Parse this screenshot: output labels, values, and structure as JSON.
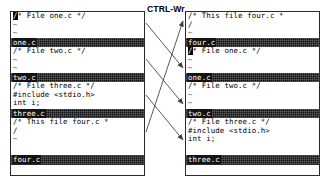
{
  "caption": {
    "key_command": "CTRL-Wr"
  },
  "colors": {
    "background": "#ffffff",
    "text": "#000000",
    "border": "#2b2b2b",
    "status_bar_bg": "#131313",
    "status_bar_text": "#ffffff",
    "arrow": "#3c3c3c"
  },
  "left_frame": {
    "name": "before-rotation",
    "windows": [
      {
        "file": "one.c",
        "cursor_on_first_char": true,
        "lines": [
          "/* File one.c */",
          "~",
          "~"
        ]
      },
      {
        "file": "two.c",
        "cursor_on_first_char": false,
        "lines": [
          "/* File two.c */",
          "~",
          "~"
        ]
      },
      {
        "file": "three.c",
        "cursor_on_first_char": false,
        "lines": [
          "/* File three.c */",
          "#include <stdio.h>",
          "int i;"
        ]
      },
      {
        "file": "four.c",
        "cursor_on_first_char": false,
        "lines": [
          "/* This file four.c *",
          "/",
          "~"
        ]
      }
    ],
    "command_line": ""
  },
  "right_frame": {
    "name": "after-rotation",
    "windows": [
      {
        "file": "four.c",
        "cursor_on_first_char": false,
        "lines": [
          "/* This file four.c *",
          "/",
          "~"
        ]
      },
      {
        "file": "one.c",
        "cursor_on_first_char": true,
        "lines": [
          "/* File one.c */",
          "~",
          "~"
        ]
      },
      {
        "file": "two.c",
        "cursor_on_first_char": false,
        "lines": [
          "/* File two.c */",
          "~",
          "~"
        ]
      },
      {
        "file": "three.c",
        "cursor_on_first_char": false,
        "lines": [
          "/* File three.c */",
          "#include <stdio.h>",
          "int i;"
        ]
      }
    ],
    "command_line": ""
  },
  "arrows": [
    {
      "name": "one-c-moves-down",
      "from": "left-window-one",
      "to": "right-window-one"
    },
    {
      "name": "two-c-moves-down",
      "from": "left-window-two",
      "to": "right-window-two"
    },
    {
      "name": "three-c-moves-down",
      "from": "left-window-three",
      "to": "right-window-three"
    },
    {
      "name": "four-c-moves-top",
      "from": "left-window-four",
      "to": "right-window-four"
    }
  ]
}
